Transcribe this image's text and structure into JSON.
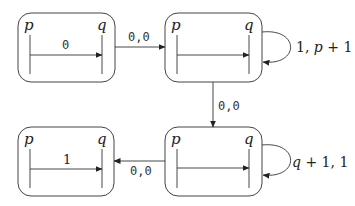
{
  "diagram": {
    "states": [
      {
        "id": "s1",
        "left_label": "p",
        "right_label": "q",
        "inner_label": "0"
      },
      {
        "id": "s2",
        "left_label": "p",
        "right_label": "q",
        "inner_label": ""
      },
      {
        "id": "s3",
        "left_label": "p",
        "right_label": "q",
        "inner_label": ""
      },
      {
        "id": "s4",
        "left_label": "p",
        "right_label": "q",
        "inner_label": "1"
      }
    ],
    "transitions": [
      {
        "from": "s1",
        "to": "s2",
        "label": "0,0"
      },
      {
        "from": "s2",
        "to": "s2",
        "label_a": "1, ",
        "label_b": "p",
        "label_c": " + 1"
      },
      {
        "from": "s2",
        "to": "s3",
        "label": "0,0"
      },
      {
        "from": "s3",
        "to": "s3",
        "label_a": "q",
        "label_b": " + 1, 1"
      },
      {
        "from": "s3",
        "to": "s4",
        "label": "0,0"
      }
    ]
  }
}
